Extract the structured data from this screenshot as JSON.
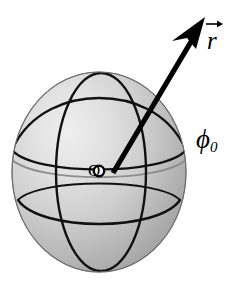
{
  "figure": {
    "background_color": "#ffffff",
    "width": 242,
    "height": 281
  },
  "sphere": {
    "name": "shaded-sphere",
    "center_x": 99,
    "center_y": 172,
    "radius_x": 87,
    "radius_y": 100,
    "fill_light": "#ececec",
    "fill_mid": "#c0c0c0",
    "fill_dark": "#8f8f8f",
    "outline_color": "#6f6f6f",
    "highlight_x": 78,
    "highlight_y": 150
  },
  "grid_lines": {
    "meridian_front": {
      "name": "meridian-ellipse",
      "color": "#000000",
      "stroke_width": 2.2
    },
    "latitude_upper": {
      "name": "upper-latitude-arc",
      "color": "#000000",
      "stroke_width": 2.4
    },
    "latitude_lower": {
      "name": "lower-latitude-arc",
      "color": "#000000",
      "stroke_width": 2.4
    },
    "equator_hidden": {
      "name": "equator-arc-hidden",
      "color": "#8a8a8a",
      "stroke_width": 1.6
    }
  },
  "vector": {
    "name": "radius-vector-arrow",
    "color": "#000000",
    "stroke_width": 5,
    "start_x": 113,
    "start_y": 173,
    "end_x": 203,
    "end_y": 22,
    "label": "r",
    "label_accent": "vector-arrow-overbar"
  },
  "labels": {
    "vector_label": "r",
    "origin_label": "O",
    "phi_symbol": "ϕ",
    "phi_subscript": "0"
  }
}
